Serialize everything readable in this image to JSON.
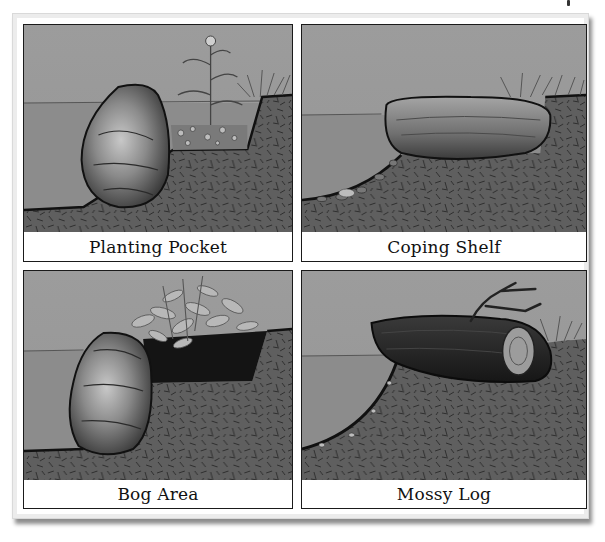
{
  "figure": {
    "colors": {
      "sky": "#9a9a9a",
      "water": "#8a8a8a",
      "soil": "#5e5e5e",
      "outline": "#1a1a1a",
      "caption_bg": "#ffffff"
    },
    "panels": [
      {
        "id": "planting-pocket",
        "caption": "Planting Pocket"
      },
      {
        "id": "coping-shelf",
        "caption": "Coping Shelf"
      },
      {
        "id": "bog-area",
        "caption": "Bog Area"
      },
      {
        "id": "mossy-log",
        "caption": "Mossy Log"
      }
    ]
  }
}
